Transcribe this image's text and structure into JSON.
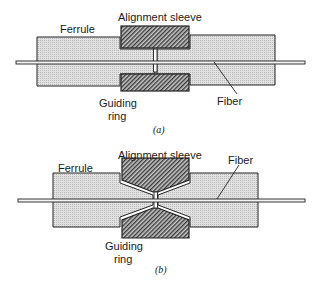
{
  "figure": {
    "panels": [
      {
        "id": "a",
        "caption": "(a)",
        "labels": {
          "alignment_sleeve": "Alignment sleeve",
          "ferrule": "Ferrule",
          "guiding_ring_line1": "Guiding",
          "guiding_ring_line2": "ring",
          "fiber": "Fiber"
        },
        "variant": "straight sleeve"
      },
      {
        "id": "b",
        "caption": "(b)",
        "labels": {
          "alignment_sleeve": "Alignment sleeve",
          "ferrule": "Ferrule",
          "guiding_ring_line1": "Guiding",
          "guiding_ring_line2": "ring",
          "fiber": "Fiber"
        },
        "variant": "tapered sleeve"
      }
    ],
    "colors": {
      "ferrule_fill": "#d9d9d9",
      "sleeve_fill": "#6e6e6e",
      "outline": "#222222",
      "fiber_fill": "#f4f4f4"
    }
  }
}
